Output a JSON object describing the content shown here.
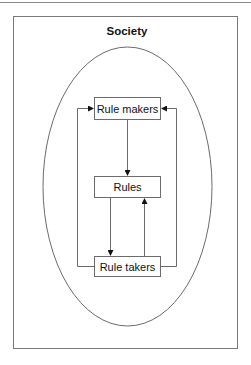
{
  "diagram": {
    "title": "Society",
    "nodes": [
      {
        "id": "rule-makers",
        "label": "Rule makers"
      },
      {
        "id": "rules",
        "label": "Rules"
      },
      {
        "id": "rule-takers",
        "label": "Rule takers"
      }
    ],
    "edges": [
      {
        "from": "Rule makers",
        "to": "Rules",
        "path": "center-down"
      },
      {
        "from": "Rules",
        "to": "Rule takers",
        "path": "down-left"
      },
      {
        "from": "Rule takers",
        "to": "Rules",
        "path": "up-right"
      },
      {
        "from": "Rule takers",
        "to": "Rule makers",
        "path": "left-loop"
      },
      {
        "from": "Rule takers",
        "to": "Rule makers",
        "path": "right-loop"
      }
    ],
    "colors": {
      "stroke": "#6b6b6b",
      "arrow": "#111111",
      "background": "#ffffff"
    }
  }
}
